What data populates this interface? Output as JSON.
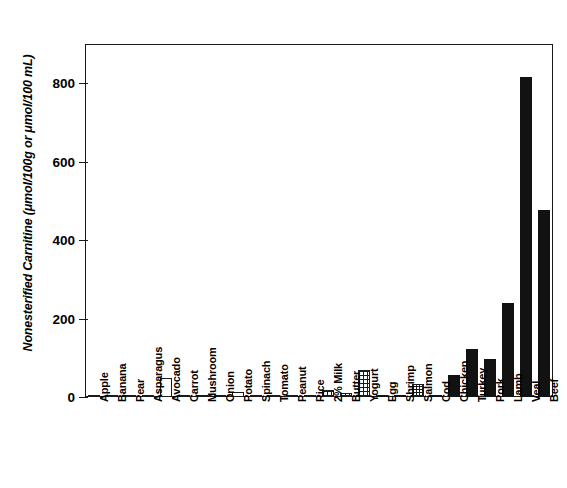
{
  "chart_data": {
    "type": "bar",
    "title": "",
    "xlabel": "",
    "ylabel": "Nonesterified Carnitine (μmol/100g or μmol/100 mL)",
    "ylim": [
      0,
      900
    ],
    "yticks": [
      0,
      200,
      400,
      600,
      800
    ],
    "ytick_labels": [
      "0",
      "200",
      "400",
      "600",
      "800"
    ],
    "grid": false,
    "legend": "none",
    "categories": [
      "Apple",
      "Banana",
      "Pear",
      "Asparagus",
      "Avocado",
      "Carrot",
      "Mushroom",
      "Onion",
      "Potato",
      "Spinach",
      "Tomato",
      "Peanut",
      "Rice",
      "2% Milk",
      "Butter",
      "Yogurt",
      "Egg",
      "Shrimp",
      "Salmon",
      "Cod",
      "Chicken",
      "Turkey",
      "Pork",
      "Lamb",
      "Veal",
      "Beef"
    ],
    "values": [
      0.5,
      0.5,
      0.5,
      1,
      48,
      2,
      1.5,
      2.5,
      12,
      1,
      1,
      0.5,
      0.5,
      18,
      9,
      68,
      2.5,
      5,
      32,
      6,
      56,
      122,
      97,
      240,
      815,
      478
    ],
    "bar_styles": [
      "open",
      "open",
      "open",
      "open",
      "open",
      "open",
      "open",
      "open",
      "open",
      "open",
      "open",
      "open",
      "open",
      "grid",
      "grid",
      "grid",
      "solid",
      "solid",
      "dots",
      "solid",
      "solid",
      "solid",
      "solid",
      "solid",
      "solid",
      "solid"
    ],
    "axis_color": "#1a1a1a",
    "bar_fill_color": "#121212",
    "background_color": "#ffffff"
  }
}
